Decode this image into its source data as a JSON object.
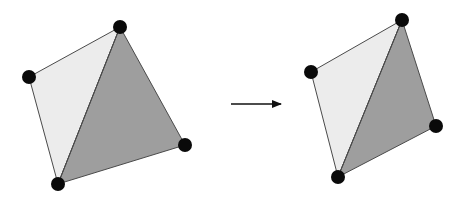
{
  "diagram": {
    "colors": {
      "background": "#ffffff",
      "light_fill": "#ececec",
      "dark_fill": "#9e9e9e",
      "edge": "#4a4a4a",
      "vertex": "#0a0a0a",
      "arrow": "#111111"
    },
    "vertex_radius": 7,
    "left_mesh": {
      "vertices": {
        "top": [
          120,
          27
        ],
        "left": [
          29,
          77
        ],
        "bottom": [
          58,
          184
        ],
        "right": [
          185,
          145
        ]
      },
      "triangles": [
        {
          "name": "light",
          "points": [
            "top",
            "left",
            "bottom"
          ],
          "fill": "light_fill"
        },
        {
          "name": "dark",
          "points": [
            "top",
            "bottom",
            "right"
          ],
          "fill": "dark_fill"
        }
      ],
      "diagonal": [
        "top",
        "bottom"
      ]
    },
    "arrow": {
      "from": [
        231,
        104
      ],
      "to": [
        281,
        104
      ]
    },
    "right_mesh": {
      "vertices": {
        "top": [
          402,
          20
        ],
        "left": [
          311,
          72
        ],
        "bottom": [
          338,
          177
        ],
        "right": [
          436,
          126
        ]
      },
      "triangles": [
        {
          "name": "light",
          "points": [
            "top",
            "left",
            "bottom"
          ],
          "fill": "light_fill"
        },
        {
          "name": "dark",
          "points": [
            "top",
            "bottom",
            "right"
          ],
          "fill": "dark_fill"
        }
      ],
      "diagonal": [
        "top",
        "bottom"
      ]
    }
  }
}
